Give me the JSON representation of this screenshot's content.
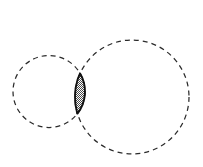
{
  "figure": {
    "background_color": "#ffffff",
    "width": 203,
    "height": 167
  },
  "chart_data": {
    "type": "diagram",
    "subtype": "venn-two-circle-lens",
    "title": "",
    "xlabel": "",
    "ylabel": "",
    "grid": false,
    "legend": "none",
    "xlim": [
      0,
      203
    ],
    "ylim": [
      0,
      167
    ],
    "shapes": [
      {
        "name": "small-circle",
        "kind": "circle",
        "cx": 49,
        "cy": 91.5,
        "r": 36,
        "stroke_style": "dashed",
        "stroke_color": "#2b2b2b",
        "stroke_width": 1.25,
        "dash_pattern": "5,4",
        "fill": "none"
      },
      {
        "name": "large-circle",
        "kind": "circle",
        "cx": 132,
        "cy": 97,
        "r": 57,
        "stroke_style": "dashed",
        "stroke_color": "#2b2b2b",
        "stroke_width": 1.25,
        "dash_pattern": "5,4",
        "fill": "none"
      },
      {
        "name": "intersection-lens",
        "kind": "lens",
        "top_point": [
          79,
          71.5
        ],
        "bottom_point": [
          79,
          113
        ],
        "max_width": 12,
        "fill": "hatched-gray",
        "fill_color": "#b8b8b8",
        "stroke_color": "#111111",
        "stroke_width": 1.9
      }
    ],
    "colors": {
      "outline": "#2b2b2b",
      "lens_outline": "#111111",
      "lens_fill": "#b8b8b8",
      "background": "#ffffff"
    }
  },
  "labels": {
    "small_circle": "",
    "large_circle": "",
    "intersection": ""
  }
}
